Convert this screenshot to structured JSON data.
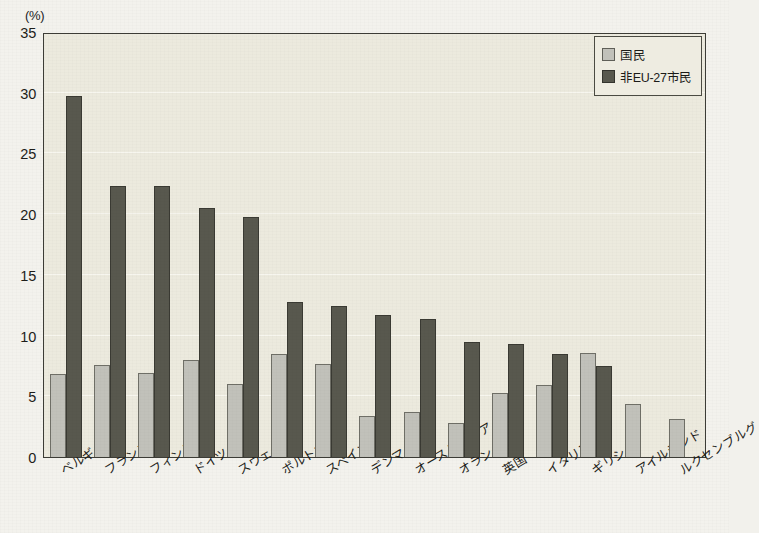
{
  "unit_label": "(%)",
  "legend": {
    "position": "top-right",
    "items": [
      {
        "label": "国民",
        "color": "#c1c1ba",
        "swatch": "light-swatch-icon"
      },
      {
        "label": "非EU-27市民",
        "color": "#58584e",
        "swatch": "dark-swatch-icon"
      }
    ]
  },
  "footnote": "",
  "chart_data": {
    "type": "bar",
    "title": "",
    "subtitle": "",
    "xlabel": "",
    "ylabel": "(%)",
    "ylim": [
      0,
      35
    ],
    "yticks": [
      0,
      5,
      10,
      15,
      20,
      25,
      30,
      35
    ],
    "ytick_labels": [
      "0",
      "5",
      "10",
      "15",
      "20",
      "25",
      "30",
      "35"
    ],
    "grid": true,
    "grid_axis": "y",
    "legend_position": "top-right",
    "categories": [
      "ベルギー",
      "フランス",
      "フィンランド",
      "ドイツ",
      "スウェーデン",
      "ポルトガル",
      "スペイン",
      "デンマーク",
      "オーストラリア",
      "オランダ",
      "英国",
      "イタリア",
      "ギリシャ",
      "アイルランド",
      "ルクセンブルグ"
    ],
    "series": [
      {
        "name": "国民",
        "color": "#c1c1ba",
        "values": [
          6.8,
          7.6,
          6.9,
          8.0,
          6.0,
          8.5,
          7.7,
          3.4,
          3.7,
          2.8,
          5.3,
          5.9,
          8.6,
          4.4,
          3.1
        ]
      },
      {
        "name": "非EU-27市民",
        "color": "#58584e",
        "values": [
          29.7,
          22.3,
          22.3,
          20.5,
          19.8,
          12.8,
          12.4,
          11.7,
          11.4,
          9.5,
          9.3,
          8.5,
          7.5,
          null,
          null
        ]
      }
    ]
  },
  "colors": {
    "plot_background": "#eceade",
    "page_background": "#f3f2ed",
    "axis": "#3c3c36",
    "gridline": "#f7f6ef",
    "light_bar": "#c1c1ba",
    "dark_bar": "#58584e"
  }
}
